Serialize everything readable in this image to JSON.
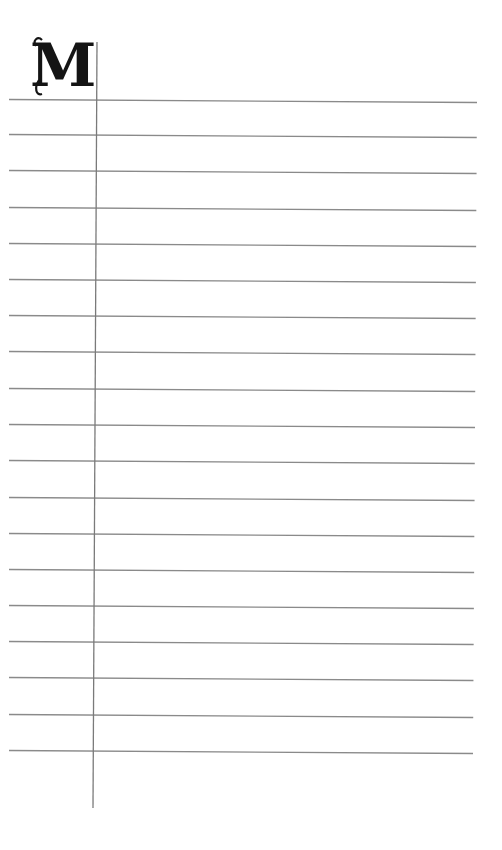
{
  "page": {
    "initial_letter": "M",
    "ruling": {
      "line_color": "#8a8a8a",
      "margin_line_color": "#7a7a7a",
      "line_count": 19,
      "line_y_left": [
        99,
        134,
        170,
        207,
        243,
        279,
        315,
        351,
        388,
        424,
        460,
        497,
        533,
        569,
        605,
        641,
        677,
        714,
        750
      ],
      "line_slope_px": 3,
      "line_x_start": 9,
      "line_x_end_top": 477,
      "line_x_end_bottom": 473,
      "margin_line": {
        "x_top": 97,
        "x_bottom": 93,
        "y_top": 42,
        "y_bottom": 808
      }
    }
  }
}
